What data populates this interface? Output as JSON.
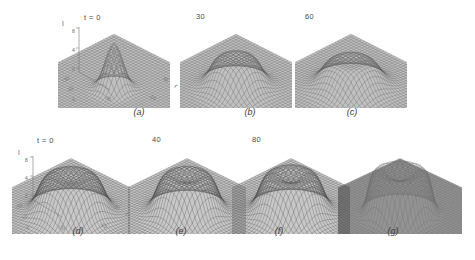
{
  "figure": {
    "caption_style": "italic-letters",
    "background": "#ffffff",
    "ink": "#3a3a3a"
  },
  "chart_data": {
    "type": "line",
    "render": "3d-wireframe-surface",
    "title": "",
    "subtitle": "",
    "xlabel": "r",
    "ylabel": "r",
    "zlabel": "I",
    "grid": false,
    "legend": "none",
    "projection": "isometric-mesh",
    "xlim": [
      -30,
      30
    ],
    "ylim": [
      -30,
      30
    ],
    "zlim": [
      0,
      8
    ],
    "z_ticks": [
      "8",
      "4",
      "0"
    ],
    "x_ticks": [
      "-30",
      "-10",
      "0",
      "-30",
      "-10",
      "30"
    ],
    "rows": [
      {
        "row_label": "row-1",
        "time_labels": [
          "t = 0",
          "30",
          "60"
        ],
        "panel_labels": [
          "(a)",
          "(b)",
          "(c)"
        ],
        "axes_on_panel": 1,
        "shape_note": "sharp Gaussian peak broadening into flat-topped plateau",
        "panels": [
          {
            "label": "(a)",
            "time": "t = 0",
            "peak_height": 8.0,
            "profile": "gaussian",
            "width": 6.0,
            "dip": 0.0,
            "base_shade": "#8d8d8d",
            "mesh_shade": "#5a5a5a"
          },
          {
            "label": "(b)",
            "time": "30",
            "peak_height": 5.6,
            "profile": "plateau",
            "width": 11.0,
            "dip": 0.35,
            "base_shade": "#8d8d8d",
            "mesh_shade": "#5a5a5a"
          },
          {
            "label": "(c)",
            "time": "60",
            "peak_height": 5.1,
            "profile": "plateau",
            "width": 12.5,
            "dip": 0.55,
            "base_shade": "#8d8d8d",
            "mesh_shade": "#5a5a5a"
          }
        ]
      },
      {
        "row_label": "row-2",
        "time_labels": [
          "t = 0",
          "40",
          "80"
        ],
        "panel_labels": [
          "(d)",
          "(e)",
          "(f)",
          "(g)"
        ],
        "axes_on_panel": 1,
        "shape_note": "flat-topped pulse steepening into a crater-top plateau",
        "panels": [
          {
            "label": "(d)",
            "time": "t = 0",
            "peak_height": 6.6,
            "profile": "crater",
            "width": 13.0,
            "dip": 0.5,
            "base_shade": "#9a9a9a",
            "mesh_shade": "#4f4f4f"
          },
          {
            "label": "(e)",
            "time": "40",
            "peak_height": 6.8,
            "profile": "crater",
            "width": 12.0,
            "dip": 0.7,
            "base_shade": "#9a9a9a",
            "mesh_shade": "#4f4f4f"
          },
          {
            "label": "(f)",
            "time": "80",
            "peak_height": 7.0,
            "profile": "crater",
            "width": 12.5,
            "dip": 0.9,
            "base_shade": "#9a9a9a",
            "mesh_shade": "#4f4f4f"
          },
          {
            "label": "(g)",
            "time": "",
            "peak_height": 7.4,
            "profile": "steep-crater",
            "width": 11.5,
            "dip": 1.0,
            "base_shade": "#3b3b3b",
            "mesh_shade": "#6e6e6e"
          }
        ]
      }
    ]
  }
}
